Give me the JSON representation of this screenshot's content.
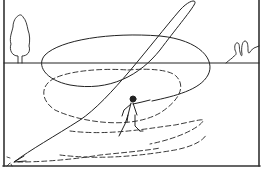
{
  "illustration": {
    "description": "Line drawing of a person throwing, with a solid looping flight path and dashed spiral paths ending in an arrow at lower left",
    "colors": {
      "background": "#ffffff",
      "line": "#222222",
      "frame": "#333333"
    },
    "elements": [
      "frame",
      "horizon-line",
      "tree",
      "bushes",
      "runner-figure",
      "solid-flight-path",
      "dashed-spiral-path",
      "arrowhead",
      "impact-marks"
    ]
  }
}
